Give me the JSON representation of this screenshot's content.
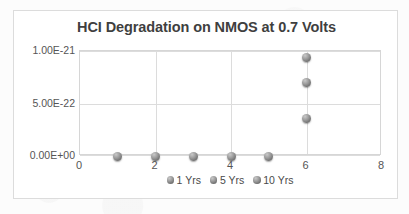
{
  "chart_data": {
    "type": "scatter",
    "title": "HCI Degradation on NMOS at 0.7 Volts",
    "xlabel": "",
    "ylabel": "",
    "xlim": [
      0,
      8
    ],
    "ylim": [
      0,
      1e-21
    ],
    "grid": true,
    "legend_position": "bottom",
    "x_ticks": [
      "0",
      "2",
      "4",
      "6",
      "8"
    ],
    "x_tick_values": [
      0,
      2,
      4,
      6,
      8
    ],
    "y_ticks": [
      "0.00E+00",
      "5.00E-22",
      "1.00E-21"
    ],
    "y_tick_values": [
      0,
      5e-22,
      1e-21
    ],
    "series": [
      {
        "name": "1 Yrs",
        "marker": "circle",
        "color": "#8a8a8a",
        "points": [
          {
            "x": 1,
            "y": 0
          },
          {
            "x": 6,
            "y": 3.6e-22
          }
        ]
      },
      {
        "name": "5 Yrs",
        "marker": "circle",
        "color": "#8a8a8a",
        "points": [
          {
            "x": 2,
            "y": 0
          },
          {
            "x": 3,
            "y": 0
          },
          {
            "x": 6,
            "y": 7e-22
          }
        ]
      },
      {
        "name": "10 Yrs",
        "marker": "circle",
        "color": "#8a8a8a",
        "points": [
          {
            "x": 4,
            "y": 0
          },
          {
            "x": 5,
            "y": 0
          },
          {
            "x": 6,
            "y": 9.4e-22
          }
        ]
      }
    ],
    "all_points": [
      {
        "x": 1,
        "y": 0
      },
      {
        "x": 2,
        "y": 0
      },
      {
        "x": 3,
        "y": 0
      },
      {
        "x": 4,
        "y": 0
      },
      {
        "x": 5,
        "y": 0
      },
      {
        "x": 6,
        "y": 3.6e-22
      },
      {
        "x": 6,
        "y": 7e-22
      },
      {
        "x": 6,
        "y": 9.4e-22
      }
    ],
    "legend": [
      {
        "label": "1 Yrs"
      },
      {
        "label": "5 Yrs"
      },
      {
        "label": "10 Yrs"
      }
    ],
    "colors": {
      "marker": "#8a8a8a",
      "gridline": "#dcdcdc",
      "plot_border": "#d6d6d6",
      "card_border": "#dcdcdc",
      "title_text": "#3f3f3f",
      "tick_text": "#555555",
      "background": "#ffffff"
    }
  }
}
